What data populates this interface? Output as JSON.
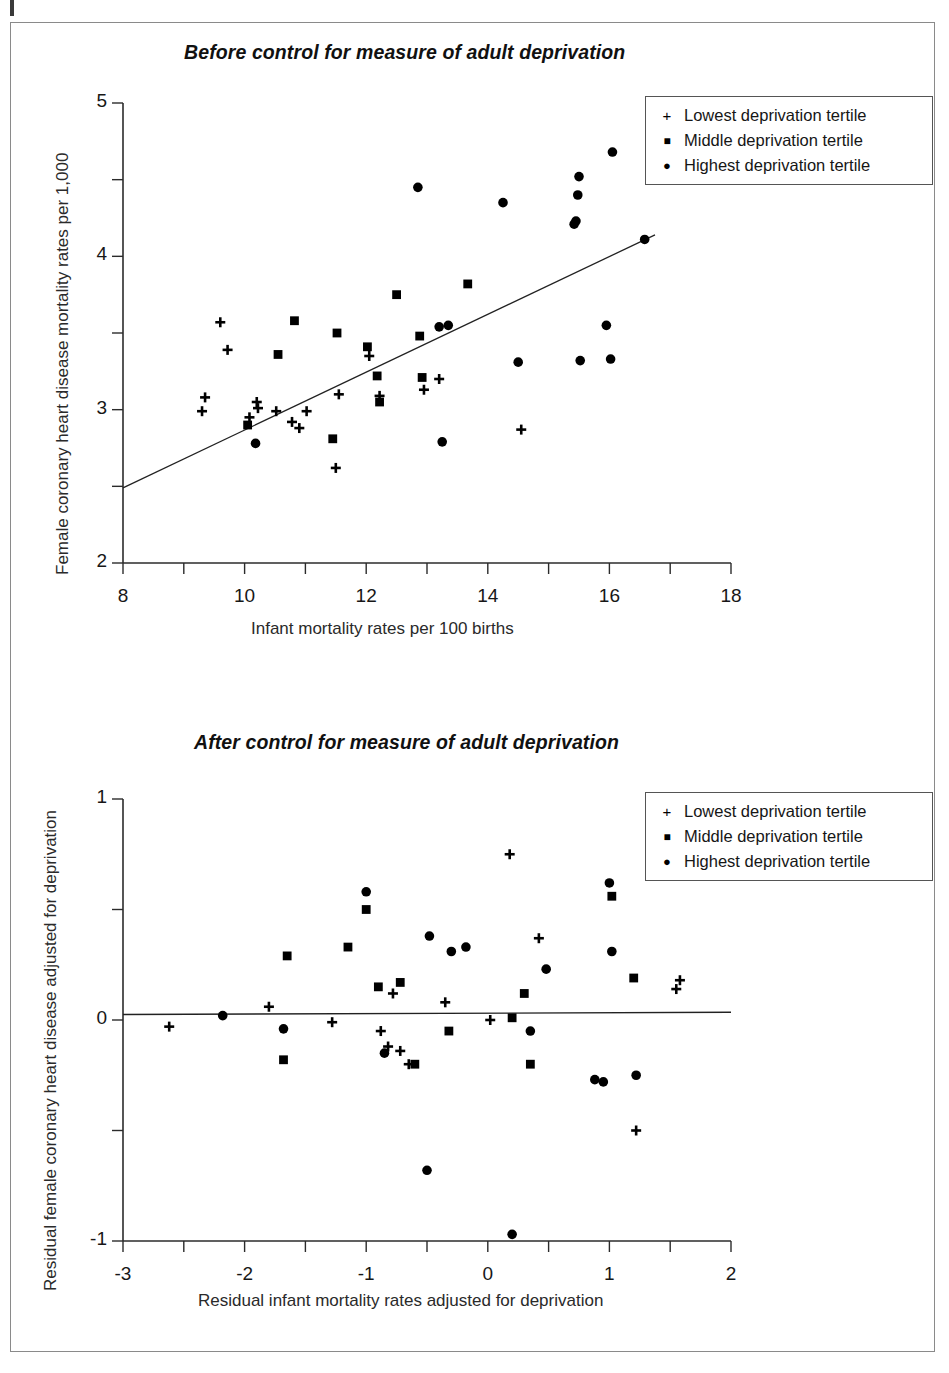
{
  "figure": {
    "legend_entries": [
      {
        "marker": "plus-icon",
        "label": "Lowest deprivation tertile"
      },
      {
        "marker": "square-icon",
        "label": "Middle deprivation tertile"
      },
      {
        "marker": "circle-icon",
        "label": "Highest deprivation tertile"
      }
    ],
    "marker_glyphs": {
      "plus": "+",
      "square": "■",
      "circle": "●"
    },
    "colors": {
      "ink": "#000000",
      "axis": "#2b2b2b",
      "frame": "#8a8a8a"
    }
  },
  "chart_data": [
    {
      "type": "scatter",
      "title": "Before control for measure of adult deprivation",
      "xlabel": "Infant mortality rates per 100 births",
      "ylabel": "Female coronary heart disease mortality rates per 1,000",
      "xlim": [
        8,
        18
      ],
      "ylim": [
        2,
        5
      ],
      "xticks": [
        8,
        10,
        12,
        14,
        16,
        18
      ],
      "xticklabels": [
        "8",
        "10",
        "12",
        "14",
        "16",
        "18"
      ],
      "xminorticks": [
        9,
        11,
        13,
        15,
        17
      ],
      "yticks": [
        2,
        3,
        4,
        5
      ],
      "yticklabels": [
        "2",
        "3",
        "4",
        "5"
      ],
      "yminorticks": [
        2.5,
        3.5,
        4.5
      ],
      "grid": false,
      "legend_position": "top-right",
      "trendline": {
        "x": [
          8.0,
          16.75
        ],
        "y": [
          2.49,
          4.14
        ]
      },
      "series": [
        {
          "name": "Lowest deprivation tertile",
          "marker": "plus",
          "points": [
            [
              9.3,
              2.99
            ],
            [
              9.35,
              3.08
            ],
            [
              9.6,
              3.57
            ],
            [
              9.72,
              3.39
            ],
            [
              10.08,
              2.95
            ],
            [
              10.2,
              3.05
            ],
            [
              10.22,
              3.01
            ],
            [
              10.52,
              2.99
            ],
            [
              10.78,
              2.92
            ],
            [
              10.9,
              2.88
            ],
            [
              11.02,
              2.99
            ],
            [
              11.5,
              2.62
            ],
            [
              11.55,
              3.1
            ],
            [
              12.05,
              3.35
            ],
            [
              12.22,
              3.09
            ],
            [
              12.95,
              3.13
            ],
            [
              13.2,
              3.2
            ],
            [
              14.55,
              2.87
            ]
          ]
        },
        {
          "name": "Middle deprivation tertile",
          "marker": "square",
          "points": [
            [
              10.05,
              2.9
            ],
            [
              10.55,
              3.36
            ],
            [
              10.82,
              3.58
            ],
            [
              11.45,
              2.81
            ],
            [
              11.52,
              3.5
            ],
            [
              12.02,
              3.41
            ],
            [
              12.18,
              3.22
            ],
            [
              12.22,
              3.05
            ],
            [
              12.5,
              3.75
            ],
            [
              12.88,
              3.48
            ],
            [
              12.92,
              3.21
            ],
            [
              13.67,
              3.82
            ]
          ]
        },
        {
          "name": "Highest deprivation tertile",
          "marker": "circle",
          "points": [
            [
              10.18,
              2.78
            ],
            [
              12.85,
              4.45
            ],
            [
              13.2,
              3.54
            ],
            [
              13.25,
              2.79
            ],
            [
              13.35,
              3.55
            ],
            [
              14.25,
              4.35
            ],
            [
              14.5,
              3.31
            ],
            [
              15.42,
              4.21
            ],
            [
              15.45,
              4.23
            ],
            [
              15.48,
              4.4
            ],
            [
              15.5,
              4.52
            ],
            [
              15.52,
              3.32
            ],
            [
              15.95,
              3.55
            ],
            [
              16.02,
              3.33
            ],
            [
              16.05,
              4.68
            ],
            [
              16.58,
              4.11
            ]
          ]
        }
      ]
    },
    {
      "type": "scatter",
      "title": "After control for measure of adult deprivation",
      "xlabel": "Residual infant mortality rates adjusted for deprivation",
      "ylabel": "Residual female coronary heart disease adjusted for deprivation",
      "xlim": [
        -3,
        2
      ],
      "ylim": [
        -1,
        1
      ],
      "xticks": [
        -3,
        -2,
        -1,
        0,
        1,
        2
      ],
      "xticklabels": [
        "-3",
        "-2",
        "-1",
        "0",
        "1",
        "2"
      ],
      "xminorticks": [
        -2.5,
        -1.5,
        -0.5,
        0.5,
        1.5
      ],
      "yticks": [
        -1,
        0,
        1
      ],
      "yticklabels": [
        "-1",
        "0",
        "1"
      ],
      "yminorticks": [
        -0.5,
        0.5
      ],
      "grid": false,
      "legend_position": "top-right",
      "trendline": {
        "x": [
          -3.0,
          2.0
        ],
        "y": [
          0.025,
          0.035
        ]
      },
      "series": [
        {
          "name": "Lowest deprivation tertile",
          "marker": "plus",
          "points": [
            [
              -2.62,
              -0.03
            ],
            [
              -1.8,
              0.06
            ],
            [
              -1.28,
              -0.01
            ],
            [
              -0.88,
              -0.05
            ],
            [
              -0.82,
              -0.12
            ],
            [
              -0.78,
              0.12
            ],
            [
              -0.72,
              -0.14
            ],
            [
              -0.65,
              -0.2
            ],
            [
              -0.35,
              0.08
            ],
            [
              0.02,
              0.0
            ],
            [
              0.18,
              0.75
            ],
            [
              0.42,
              0.37
            ],
            [
              1.22,
              -0.5
            ],
            [
              1.55,
              0.14
            ],
            [
              1.58,
              0.18
            ]
          ]
        },
        {
          "name": "Middle deprivation tertile",
          "marker": "square",
          "points": [
            [
              -1.68,
              -0.18
            ],
            [
              -1.65,
              0.29
            ],
            [
              -1.15,
              0.33
            ],
            [
              -1.0,
              0.5
            ],
            [
              -0.9,
              0.15
            ],
            [
              -0.72,
              0.17
            ],
            [
              -0.6,
              -0.2
            ],
            [
              -0.32,
              -0.05
            ],
            [
              0.2,
              0.01
            ],
            [
              0.3,
              0.12
            ],
            [
              0.35,
              -0.2
            ],
            [
              1.02,
              0.56
            ],
            [
              1.2,
              0.19
            ]
          ]
        },
        {
          "name": "Highest deprivation tertile",
          "marker": "circle",
          "points": [
            [
              -2.18,
              0.02
            ],
            [
              -1.68,
              -0.04
            ],
            [
              -0.85,
              -0.15
            ],
            [
              -1.0,
              0.58
            ],
            [
              -0.5,
              -0.68
            ],
            [
              -0.48,
              0.38
            ],
            [
              -0.3,
              0.31
            ],
            [
              -0.18,
              0.33
            ],
            [
              0.2,
              -0.97
            ],
            [
              0.35,
              -0.05
            ],
            [
              0.48,
              0.23
            ],
            [
              0.88,
              -0.27
            ],
            [
              0.95,
              -0.28
            ],
            [
              1.0,
              0.62
            ],
            [
              1.02,
              0.31
            ],
            [
              1.22,
              -0.25
            ]
          ]
        }
      ]
    }
  ]
}
